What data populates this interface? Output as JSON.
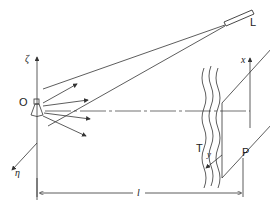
{
  "diagram": {
    "labels": {
      "origin": "O",
      "laser": "L",
      "zeta_axis": "ζ",
      "eta_axis": "η",
      "x_axis": "x",
      "y_axis": "y",
      "turbulence": "T",
      "plane": "P",
      "distance": "l"
    },
    "colors": {
      "line": "#333333",
      "background": "#ffffff"
    }
  }
}
